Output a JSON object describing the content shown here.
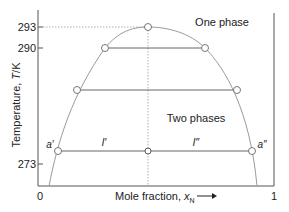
{
  "diagram": {
    "colors": {
      "axis": "#555555",
      "curve": "#9a9a9a",
      "tie_line": "#666666",
      "dotted": "#b0b0b0",
      "text": "#222222",
      "point_fill": "#ffffff",
      "point_stroke": "#777777"
    },
    "axes": {
      "y_label": "Temperature, T/K",
      "y_label_prefix": "Temperature, ",
      "y_label_var": "T",
      "y_label_suffix": "/K",
      "y_ticks": [
        {
          "label": "293",
          "value": 293
        },
        {
          "label": "290",
          "value": 290
        },
        {
          "label": "273",
          "value": 273
        }
      ],
      "x_label_prefix": "Mole fraction, ",
      "x_label_var": "x",
      "x_label_sub": "N",
      "x_arrow": "→",
      "x_ticks": [
        {
          "label": "0",
          "value": 0
        },
        {
          "label": "1",
          "value": 1
        }
      ]
    },
    "regions": {
      "one_phase": "One phase",
      "two_phases": "Two phases"
    },
    "points": {
      "a_prime": "a′",
      "a_double_prime": "a″",
      "l_prime": "l′",
      "l_double_prime": "l″"
    },
    "critical_temperature": 293,
    "tie_lines": [
      {
        "temperature": 290
      },
      {
        "temperature": "intermediate"
      },
      {
        "temperature": 273
      }
    ]
  }
}
